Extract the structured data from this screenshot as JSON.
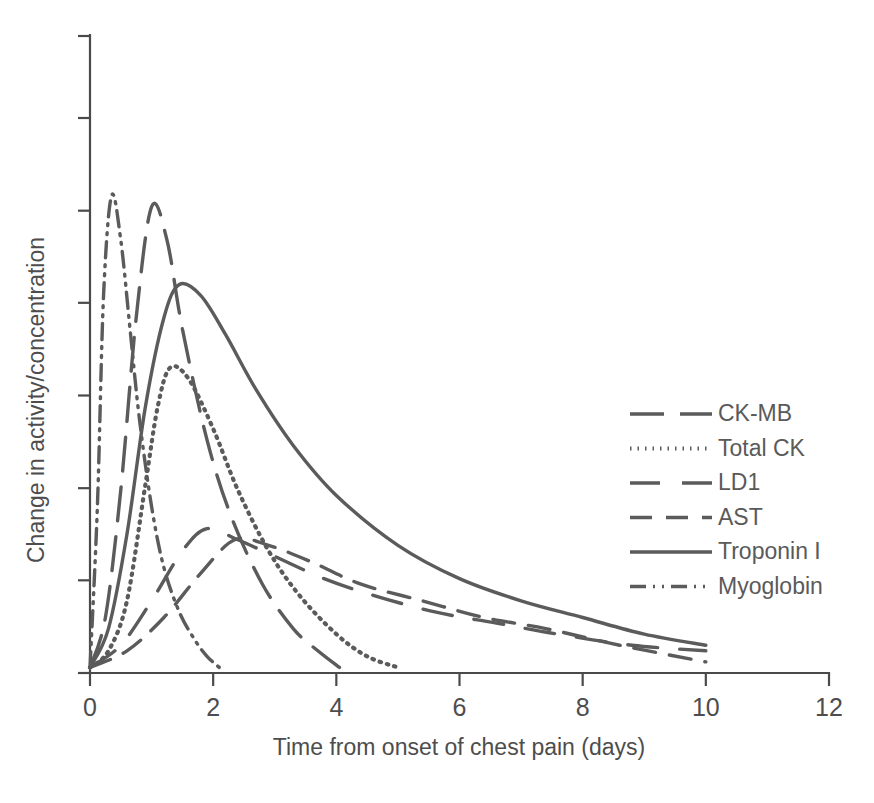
{
  "chart_data": {
    "type": "line",
    "title": "",
    "xlabel": "Time from onset of chest pain (days)",
    "ylabel": "Change in activity/concentration",
    "xlim": [
      0,
      12
    ],
    "ylim": [
      0,
      100
    ],
    "xticks": [
      0,
      2,
      4,
      6,
      8,
      10,
      12
    ],
    "xtick_labels": [
      "0",
      "2",
      "4",
      "6",
      "8",
      "10",
      "12"
    ],
    "yticks": [
      0,
      16.7,
      33.3,
      50,
      66.7,
      83.3,
      100
    ],
    "ytick_labels": [
      "",
      "",
      "",
      "",
      "",
      "",
      ""
    ],
    "grid": false,
    "legend_position": "right-middle",
    "line_color": "#5b5b5b",
    "axis_color": "#4a4a4a",
    "series": [
      {
        "name": "CK-MB",
        "dash": "long-dash",
        "peak_x": 1.0,
        "peak_y": 84,
        "end_x": 4.05,
        "x": [
          0.0,
          0.25,
          0.5,
          0.75,
          1.0,
          1.25,
          1.5,
          1.9,
          2.3,
          2.8,
          3.3,
          3.7,
          4.05
        ],
        "y": [
          1,
          10,
          33,
          64,
          84,
          78,
          62,
          42,
          28,
          16,
          8,
          4,
          1
        ]
      },
      {
        "name": "Total CK",
        "dash": "dotted",
        "peak_x": 1.3,
        "peak_y": 55,
        "end_x": 5.0,
        "x": [
          0.0,
          0.3,
          0.6,
          0.9,
          1.1,
          1.3,
          1.6,
          2.0,
          2.4,
          2.9,
          3.4,
          4.0,
          4.5,
          5.0
        ],
        "y": [
          1,
          4,
          13,
          34,
          48,
          55,
          53,
          44,
          33,
          22,
          14,
          7,
          3,
          1
        ]
      },
      {
        "name": "LD1",
        "dash": "long-dash-gap",
        "peak_x": 1.9,
        "peak_y": 26,
        "end_x": 10.0,
        "x": [
          0.0,
          0.5,
          1.0,
          1.5,
          1.9,
          2.4,
          3.0,
          3.8,
          4.6,
          5.6,
          6.6,
          7.6,
          8.8,
          10.0
        ],
        "y": [
          1,
          5,
          13,
          22,
          26,
          24,
          21,
          17,
          14,
          11,
          9,
          7,
          5,
          4
        ]
      },
      {
        "name": "AST",
        "dash": "dashed",
        "peak_x": 2.35,
        "peak_y": 24,
        "end_x": 10.0,
        "x": [
          0.0,
          0.6,
          1.2,
          1.8,
          2.35,
          2.9,
          3.6,
          4.4,
          5.4,
          6.4,
          7.4,
          8.6,
          10.0
        ],
        "y": [
          1,
          4,
          10,
          18,
          24,
          23,
          20,
          16,
          13,
          10,
          8,
          5,
          2
        ]
      },
      {
        "name": "Troponin I",
        "dash": "solid",
        "peak_x": 1.45,
        "peak_y": 70,
        "end_x": 10.0,
        "x": [
          0.0,
          0.3,
          0.6,
          0.9,
          1.2,
          1.45,
          1.8,
          2.2,
          2.7,
          3.3,
          4.0,
          5.0,
          6.0,
          7.0,
          8.0,
          9.0,
          10.0
        ],
        "y": [
          1,
          8,
          25,
          48,
          64,
          70,
          68,
          61,
          51,
          41,
          32,
          23,
          17,
          13,
          10,
          7,
          5
        ]
      },
      {
        "name": "Myoglobin",
        "dash": "dash-dot-dot",
        "peak_x": 0.35,
        "peak_y": 86,
        "end_x": 2.1,
        "x": [
          0.0,
          0.12,
          0.22,
          0.35,
          0.5,
          0.65,
          0.8,
          1.0,
          1.2,
          1.45,
          1.7,
          1.9,
          2.1
        ],
        "y": [
          1,
          30,
          68,
          86,
          78,
          62,
          46,
          30,
          19,
          11,
          6,
          3,
          1
        ]
      }
    ],
    "legend": [
      {
        "label": "CK-MB",
        "dash": "long-dash"
      },
      {
        "label": "Total CK",
        "dash": "dotted"
      },
      {
        "label": "LD1",
        "dash": "long-dash-gap"
      },
      {
        "label": "AST",
        "dash": "dashed"
      },
      {
        "label": "Troponin I",
        "dash": "solid"
      },
      {
        "label": "Myoglobin",
        "dash": "dash-dot-dot"
      }
    ]
  }
}
